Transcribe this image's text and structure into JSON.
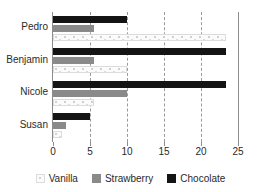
{
  "chart_data": {
    "type": "bar",
    "orientation": "horizontal",
    "title": "",
    "xlabel": "",
    "ylabel": "",
    "categories": [
      "Pedro",
      "Benjamin",
      "Nicole",
      "Susan"
    ],
    "series": [
      {
        "name": "Vanilla",
        "color": "#fbfbfb",
        "values": [
          23.4,
          10.0,
          5.5,
          1.2
        ]
      },
      {
        "name": "Strawberry",
        "color": "#8a8a8a",
        "values": [
          5.5,
          5.5,
          10.0,
          1.8
        ]
      },
      {
        "name": "Chocolate",
        "color": "#141414",
        "values": [
          10.0,
          23.4,
          23.4,
          5.0
        ]
      }
    ],
    "bar_order_top_to_bottom": [
      "Chocolate",
      "Strawberry",
      "Vanilla"
    ],
    "xlim": [
      0,
      25
    ],
    "xticks": [
      0,
      5,
      10,
      15,
      20,
      25
    ],
    "xtick_labels": [
      "0",
      "5",
      "10",
      "15",
      "20",
      "25"
    ],
    "gridlines": [
      5,
      10,
      15,
      20
    ],
    "grid": true,
    "grid_style": "dashed",
    "legend_position": "bottom",
    "legend": [
      "Vanilla",
      "Strawberry",
      "Chocolate"
    ]
  },
  "axis": {
    "left_label_color": "#2a2a2a",
    "line_color": "#8c8c8c"
  }
}
